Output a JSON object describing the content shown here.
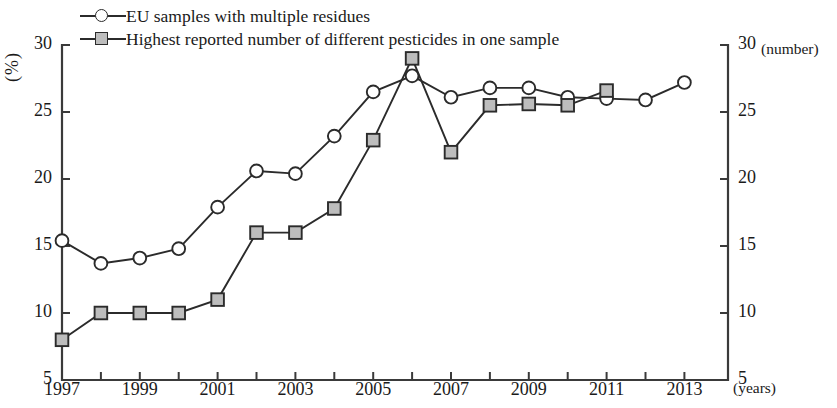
{
  "legend": {
    "items": [
      {
        "marker": "circle",
        "label": "EU samples with multiple residues"
      },
      {
        "marker": "square",
        "label": "Highest reported number of different pesticides in one sample"
      }
    ]
  },
  "axes": {
    "left_unit": "(%)",
    "right_unit": "(number)",
    "x_unit": "(years)",
    "y_ticks": [
      "30",
      "25",
      "20",
      "15",
      "10",
      "5"
    ],
    "y_ticks_right": [
      "30",
      "25",
      "20",
      "15",
      "10",
      "5"
    ],
    "x_ticks": [
      "1997",
      "1999",
      "2001",
      "2003",
      "2005",
      "2007",
      "2009",
      "2011",
      "2013"
    ]
  },
  "colors": {
    "line": "#2b2b2b",
    "square_fill": "#bdbdbd",
    "circle_fill": "#ffffff",
    "axis": "#3a3a3a",
    "background": "#ffffff"
  },
  "chart_data": {
    "type": "line",
    "title": "",
    "xlabel": "(years)",
    "ylabel": "(%)",
    "y2label": "(number)",
    "xlim": [
      1996.5,
      2013.7
    ],
    "ylim": [
      5,
      30
    ],
    "y2lim": [
      5,
      30
    ],
    "grid": false,
    "legend_position": "top-left",
    "x": [
      1997,
      1998,
      1999,
      2000,
      2001,
      2002,
      2003,
      2004,
      2005,
      2006,
      2007,
      2008,
      2009,
      2010,
      2011,
      2012,
      2013
    ],
    "series": [
      {
        "name": "EU samples with multiple residues",
        "marker": "circle",
        "axis": "left",
        "unit": "%",
        "values": [
          15.4,
          13.7,
          14.1,
          14.8,
          17.9,
          20.6,
          20.4,
          23.2,
          26.5,
          27.7,
          26.1,
          26.8,
          26.8,
          26.1,
          26.0,
          25.9,
          27.2
        ]
      },
      {
        "name": "Highest reported number of different pesticides in one sample",
        "marker": "square",
        "axis": "right",
        "unit": "number",
        "values": [
          8,
          10,
          10,
          10,
          11,
          16,
          16,
          17.8,
          22.9,
          29,
          22,
          25.5,
          25.6,
          25.5,
          26.6,
          null,
          null
        ]
      }
    ]
  }
}
